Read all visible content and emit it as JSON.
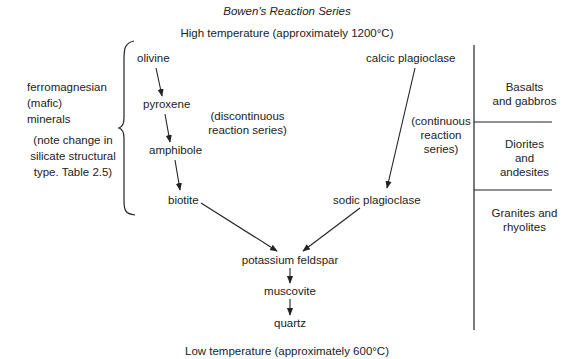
{
  "title": "Bowen's Reaction Series",
  "high_temp": "High temperature (approximately 1200°C)",
  "low_temp": "Low temperature (approximately 600°C)",
  "left_group": {
    "label_lines": [
      "ferromagnesian",
      "(mafic)",
      "minerals"
    ],
    "note_lines": [
      "(note change in",
      "silicate structural",
      "type. Table 2.5)"
    ]
  },
  "discontinuous": {
    "label_lines": [
      "(discontinuous",
      "reaction series)"
    ],
    "minerals": [
      "olivine",
      "pyroxene",
      "amphibole",
      "biotite"
    ]
  },
  "continuous": {
    "label_lines": [
      "(continuous",
      "reaction",
      "series)"
    ],
    "minerals": [
      "calcic plagioclase",
      "sodic plagioclase"
    ]
  },
  "convergent": {
    "minerals": [
      "potassium feldspar",
      "muscovite",
      "quartz"
    ]
  },
  "rock_types": [
    {
      "lines": [
        "Basalts",
        "and gabbros"
      ]
    },
    {
      "lines": [
        "Diorites",
        "and",
        "andesites"
      ]
    },
    {
      "lines": [
        "Granites and",
        "rhyolites"
      ]
    }
  ],
  "colors": {
    "ink": "#222222",
    "background": "#ffffff"
  }
}
